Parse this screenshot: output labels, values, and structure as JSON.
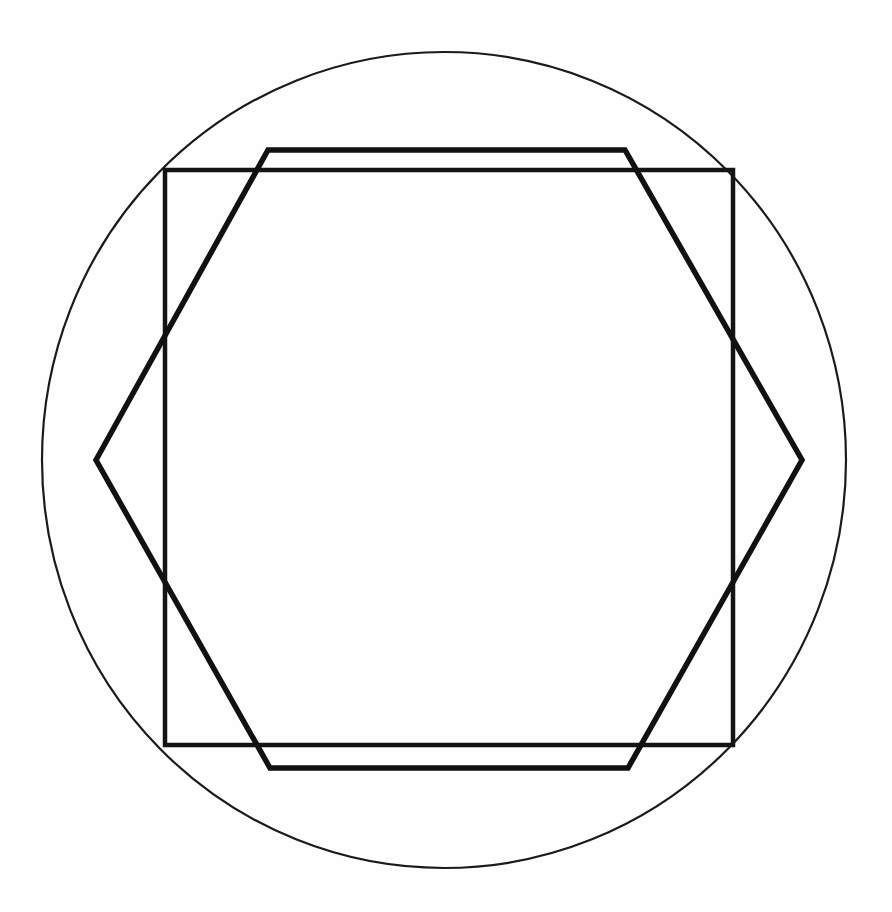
{
  "figure": {
    "background_color": "#fefefe",
    "canvas": {
      "width": 892,
      "height": 912
    }
  },
  "chart_data": {
    "type": "diagram",
    "subtitle": "",
    "xlabel": "",
    "ylabel": "",
    "grid": false,
    "legend": "none",
    "axis_visible": false,
    "tick_labels": [],
    "annotations": [],
    "units": "pixels",
    "xlim": [
      0,
      892
    ],
    "ylim": [
      0,
      912
    ],
    "shapes": [
      {
        "name": "circumscribed-circle",
        "kind": "circle",
        "center": [
          444,
          460
        ],
        "radius_x": 402,
        "radius_y": 408,
        "stroke_color": "#1a1a1a",
        "stroke_width": 2.2,
        "fill": "none"
      },
      {
        "name": "inscribed-square",
        "kind": "polygon",
        "points": [
          [
            165,
            170
          ],
          [
            733,
            170
          ],
          [
            733,
            745
          ],
          [
            165,
            745
          ]
        ],
        "side_length": 568,
        "stroke_color": "#141414",
        "stroke_width": 4.5,
        "fill": "none"
      },
      {
        "name": "inscribed-hexagon",
        "kind": "polygon",
        "points": [
          [
            96,
            460
          ],
          [
            268,
            150
          ],
          [
            625,
            150
          ],
          [
            802,
            460
          ],
          [
            628,
            768
          ],
          [
            270,
            768
          ]
        ],
        "vertex_count": 6,
        "stroke_color": "#111111",
        "stroke_width": 5.5,
        "fill": "none"
      }
    ]
  }
}
